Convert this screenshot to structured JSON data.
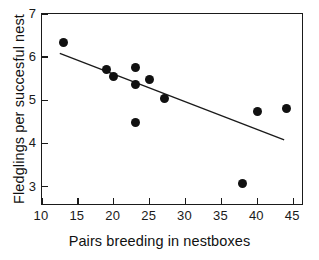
{
  "chart_data": {
    "type": "scatter",
    "title": "",
    "xlabel": "Pairs breeding in nestboxes",
    "ylabel": "Fledglings per succesful nest",
    "xlim": [
      10,
      46.5
    ],
    "ylim": [
      2.55,
      7.0
    ],
    "xticks": [
      10,
      15,
      20,
      25,
      30,
      35,
      40,
      45
    ],
    "yticks": [
      3,
      4,
      5,
      6,
      7
    ],
    "xtick_labels": [
      "10",
      "15",
      "20",
      "25",
      "30",
      "35",
      "40",
      "45"
    ],
    "ytick_labels": [
      "3",
      "4",
      "5",
      "6",
      "7"
    ],
    "grid": false,
    "legend": null,
    "marker": {
      "shape": "circle",
      "color": "#111111",
      "size": 9
    },
    "points": [
      {
        "x": 13,
        "y": 6.33
      },
      {
        "x": 19,
        "y": 5.72
      },
      {
        "x": 20,
        "y": 5.56
      },
      {
        "x": 23,
        "y": 5.75
      },
      {
        "x": 23,
        "y": 5.37
      },
      {
        "x": 23,
        "y": 4.49
      },
      {
        "x": 25,
        "y": 5.48
      },
      {
        "x": 27,
        "y": 5.04
      },
      {
        "x": 38,
        "y": 3.07
      },
      {
        "x": 40,
        "y": 4.73
      },
      {
        "x": 44,
        "y": 4.82
      }
    ],
    "series": [
      {
        "name": "Fledglings per succesful nest",
        "x": [
          13,
          19,
          20,
          23,
          23,
          23,
          25,
          27,
          38,
          40,
          44
        ],
        "values": [
          6.33,
          5.72,
          5.56,
          5.75,
          5.37,
          4.49,
          5.48,
          5.04,
          3.07,
          4.73,
          4.82
        ]
      }
    ],
    "trendline": {
      "type": "linear-fit",
      "color": "#1a1a1a",
      "x_start": 12.5,
      "y_start": 6.08,
      "x_end": 44.0,
      "y_end": 4.06
    }
  }
}
